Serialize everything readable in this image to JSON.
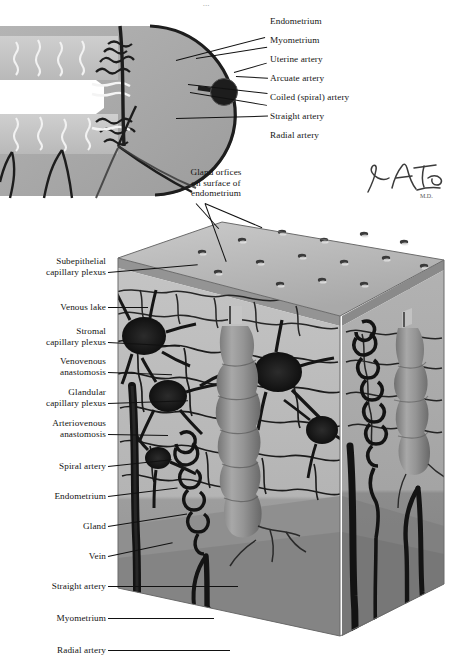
{
  "plate": {
    "title": "Endometrial vasculature",
    "illustrator_signature": "F. Netter",
    "top_cut_text": "..."
  },
  "inset": {
    "caption": "Uterine wall cross-section (wedge)",
    "labels": [
      {
        "id": "endometrium",
        "text": "Endometrium"
      },
      {
        "id": "myometrium",
        "text": "Myometrium"
      },
      {
        "id": "uterine",
        "text": "Uterine artery"
      },
      {
        "id": "arcuate",
        "text": "Arcuate artery"
      },
      {
        "id": "coiled",
        "text": "Coiled (spiral) artery"
      },
      {
        "id": "straight",
        "text": "Straight artery"
      },
      {
        "id": "radial",
        "text": "Radial artery"
      }
    ]
  },
  "block": {
    "caption": "Three-dimensional block of endometrium and myometrium",
    "gland_orifice_label": {
      "line1": "Gland orfices",
      "line2": "on surface of",
      "line3": "endometrium"
    },
    "labels": [
      {
        "id": "subepithelial",
        "line1": "Subepithelial",
        "line2": "capillary plexus"
      },
      {
        "id": "venous-lake",
        "line1": "Venous lake",
        "line2": ""
      },
      {
        "id": "stromal",
        "line1": "Stromal",
        "line2": "capillary plexus"
      },
      {
        "id": "venovenous",
        "line1": "Venovenous",
        "line2": "anastomosis"
      },
      {
        "id": "glandular",
        "line1": "Glandular",
        "line2": "capillary plexus"
      },
      {
        "id": "arteriovenous",
        "line1": "Arteriovenous",
        "line2": "anastomosis"
      },
      {
        "id": "spiral-artery",
        "line1": "Spiral artery",
        "line2": ""
      },
      {
        "id": "endometrium",
        "line1": "Endometrium",
        "line2": ""
      },
      {
        "id": "gland",
        "line1": "Gland",
        "line2": ""
      },
      {
        "id": "vein",
        "line1": "Vein",
        "line2": ""
      },
      {
        "id": "straight-art",
        "line1": "Straight artery",
        "line2": ""
      },
      {
        "id": "myometrium",
        "line1": "Myometrium",
        "line2": ""
      },
      {
        "id": "radial-artery",
        "line1": "Radial artery",
        "line2": ""
      }
    ]
  },
  "colors": {
    "page_background": "#ffffff",
    "ink": "#141414",
    "vessel_dark": "#1d1d1d",
    "endometrium_light": "#c9c9c9",
    "endometrium_mid": "#b0b0b0",
    "myometrium_dark": "#9a9a9a",
    "surface_top": "#b8b8b8",
    "gland_body": "#8c8c8c",
    "leader_line": "#111111"
  }
}
